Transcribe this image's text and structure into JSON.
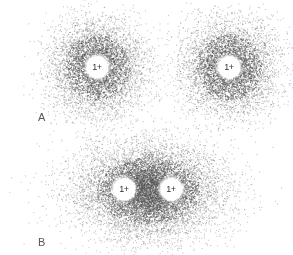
{
  "panels": [
    {
      "label": "A",
      "label_pos": [
        38,
        111
      ],
      "description": "Two separate hydrogen atoms, each with a spherical electron cloud",
      "nuclei": [
        {
          "charge": "1+",
          "x": 97,
          "y": 67
        },
        {
          "charge": "1+",
          "x": 229,
          "y": 67
        }
      ],
      "clouds": [
        {
          "cx": 97,
          "cy": 67,
          "rx": 55,
          "ry": 55
        },
        {
          "cx": 229,
          "cy": 67,
          "rx": 55,
          "ry": 55
        }
      ]
    },
    {
      "label": "B",
      "label_pos": [
        38,
        236
      ],
      "description": "Hydrogen molecule with shared, elongated electron cloud between two nuclei",
      "nuclei": [
        {
          "charge": "1+",
          "x": 124,
          "y": 189
        },
        {
          "charge": "1+",
          "x": 171,
          "y": 189
        }
      ],
      "clouds": [
        {
          "cx": 148,
          "cy": 190,
          "rx": 86,
          "ry": 55
        }
      ]
    }
  ],
  "colors": {
    "dot": "#555555",
    "background": "#ffffff"
  }
}
